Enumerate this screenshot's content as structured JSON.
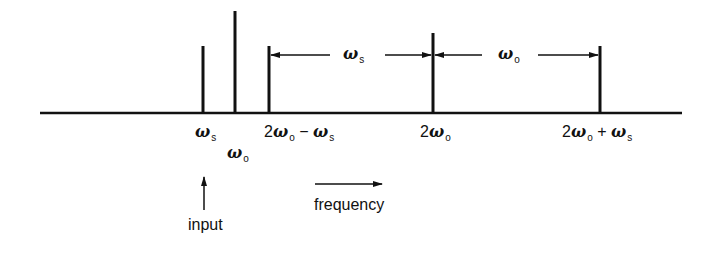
{
  "diagram": {
    "type": "frequency-spectrum",
    "axis": {
      "label": "frequency"
    },
    "lines": [
      {
        "id": "ws",
        "label_sym": "ω",
        "label_sub": "s",
        "x": 203,
        "top": 46
      },
      {
        "id": "wo",
        "label_sym": "ω",
        "label_sub": "o",
        "x": 235,
        "top": 11
      },
      {
        "id": "2wo-ws",
        "prefix": "2",
        "label_sym": "ω",
        "label_sub": "o",
        "op": " − ",
        "sym2": "ω",
        "sub2": "s",
        "x": 269,
        "top": 46
      },
      {
        "id": "2wo",
        "prefix": "2",
        "label_sym": "ω",
        "label_sub": "o",
        "x": 433,
        "top": 33
      },
      {
        "id": "2wo+ws",
        "prefix": "2",
        "label_sym": "ω",
        "label_sub": "o",
        "op": " + ",
        "sym2": "ω",
        "sub2": "s",
        "x": 600,
        "top": 46
      }
    ],
    "spacing": [
      {
        "label_sym": "ω",
        "label_sub": "s",
        "from": "2wo-ws",
        "to": "2wo"
      },
      {
        "label_sym": "ω",
        "label_sub": "o",
        "from": "2wo",
        "to": "2wo+ws"
      }
    ],
    "input_label": "input",
    "frequency_label": "frequency",
    "two": "2",
    "minus": " − ",
    "plus": " + ",
    "omega": "ω",
    "s": "s",
    "o": "o"
  }
}
